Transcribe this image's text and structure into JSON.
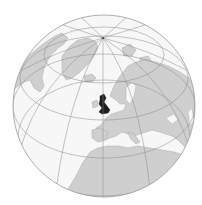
{
  "map": {
    "projection": "orthographic",
    "highlighted_region": "United Kingdom",
    "visible_regions": [
      "Greenland",
      "Canadian Arctic",
      "Iceland",
      "Scandinavia",
      "Europe",
      "North Africa",
      "Mediterranean Sea",
      "Atlantic Ocean",
      "Arctic Ocean"
    ],
    "colors": {
      "ocean": "#f7f7f7",
      "land": "#cfcfcf",
      "land_stroke": "#a8a8a8",
      "graticule": "#8a8a8a",
      "globe_outline": "#9a9a9a",
      "highlight": "#1e1e1e",
      "background": "#ffffff"
    },
    "globe": {
      "cx": 104,
      "cy": 106,
      "r": 91
    },
    "north_pole": {
      "x": 103,
      "y": 38
    }
  }
}
